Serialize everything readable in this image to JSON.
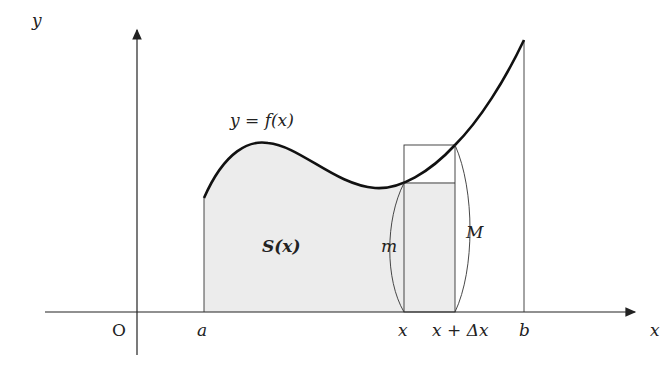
{
  "diagram": {
    "axes": {
      "x_label": "x",
      "y_label": "y",
      "origin_label": "O"
    },
    "curve_label": "y = f(x)",
    "area_label": "S(x)",
    "ticks": [
      "a",
      "x",
      "x + Δx",
      "b"
    ],
    "rect_labels": {
      "min": "m",
      "max": "M"
    },
    "colors": {
      "curve": "#111111",
      "shade": "#ececec",
      "lines": "#333333"
    }
  }
}
